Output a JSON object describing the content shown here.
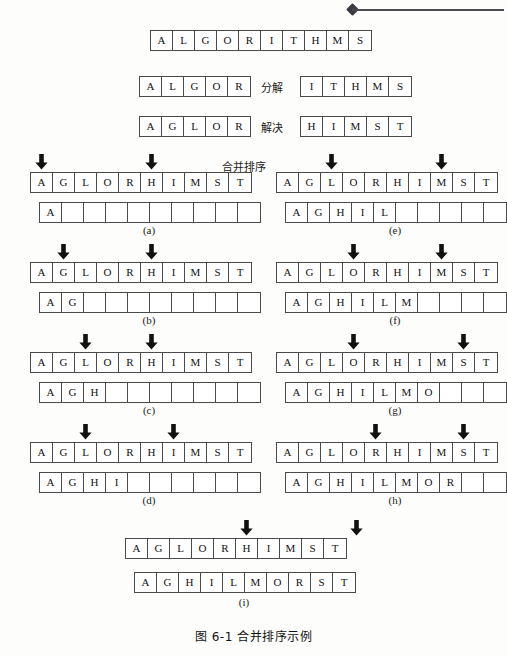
{
  "figure": {
    "caption": "图 6-1  合并排序示例",
    "header_decoration": "diamond-rule"
  },
  "stages": {
    "full": {
      "label": "",
      "cells": [
        "A",
        "L",
        "G",
        "O",
        "R",
        "I",
        "T",
        "H",
        "M",
        "S"
      ]
    },
    "divide": {
      "label": "分解",
      "left": [
        "A",
        "L",
        "G",
        "O",
        "R"
      ],
      "right": [
        "I",
        "T",
        "H",
        "M",
        "S"
      ]
    },
    "conquer": {
      "label": "解决",
      "left": [
        "A",
        "G",
        "L",
        "O",
        "R"
      ],
      "right": [
        "H",
        "I",
        "M",
        "S",
        "T"
      ]
    },
    "merge_label": "合并排序"
  },
  "panels": [
    {
      "id": "a",
      "label": "(a)",
      "left": [
        "A",
        "G",
        "L",
        "O",
        "R"
      ],
      "right": [
        "H",
        "I",
        "M",
        "S",
        "T"
      ],
      "left_pointer": 1,
      "right_pointer": 1,
      "output": [
        "A",
        "",
        "",
        "",
        "",
        "",
        "",
        "",
        "",
        ""
      ]
    },
    {
      "id": "b",
      "label": "(b)",
      "left": [
        "A",
        "G",
        "L",
        "O",
        "R"
      ],
      "right": [
        "H",
        "I",
        "M",
        "S",
        "T"
      ],
      "left_pointer": 2,
      "right_pointer": 1,
      "output": [
        "A",
        "G",
        "",
        "",
        "",
        "",
        "",
        "",
        "",
        ""
      ]
    },
    {
      "id": "c",
      "label": "(c)",
      "left": [
        "A",
        "G",
        "L",
        "O",
        "R"
      ],
      "right": [
        "H",
        "I",
        "M",
        "S",
        "T"
      ],
      "left_pointer": 3,
      "right_pointer": 1,
      "output": [
        "A",
        "G",
        "H",
        "",
        "",
        "",
        "",
        "",
        "",
        ""
      ]
    },
    {
      "id": "d",
      "label": "(d)",
      "left": [
        "A",
        "G",
        "L",
        "O",
        "R"
      ],
      "right": [
        "H",
        "I",
        "M",
        "S",
        "T"
      ],
      "left_pointer": 3,
      "right_pointer": 2,
      "output": [
        "A",
        "G",
        "H",
        "I",
        "",
        "",
        "",
        "",
        "",
        ""
      ]
    },
    {
      "id": "e",
      "label": "(e)",
      "left": [
        "A",
        "G",
        "L",
        "O",
        "R"
      ],
      "right": [
        "H",
        "I",
        "M",
        "S",
        "T"
      ],
      "left_pointer": 3,
      "right_pointer": 3,
      "output": [
        "A",
        "G",
        "H",
        "I",
        "L",
        "",
        "",
        "",
        "",
        ""
      ]
    },
    {
      "id": "f",
      "label": "(f)",
      "left": [
        "A",
        "G",
        "L",
        "O",
        "R"
      ],
      "right": [
        "H",
        "I",
        "M",
        "S",
        "T"
      ],
      "left_pointer": 4,
      "right_pointer": 3,
      "output": [
        "A",
        "G",
        "H",
        "I",
        "L",
        "M",
        "",
        "",
        "",
        ""
      ]
    },
    {
      "id": "g",
      "label": "(g)",
      "left": [
        "A",
        "G",
        "L",
        "O",
        "R"
      ],
      "right": [
        "H",
        "I",
        "M",
        "S",
        "T"
      ],
      "left_pointer": 4,
      "right_pointer": 4,
      "output": [
        "A",
        "G",
        "H",
        "I",
        "L",
        "M",
        "O",
        "",
        "",
        ""
      ]
    },
    {
      "id": "h",
      "label": "(h)",
      "left": [
        "A",
        "G",
        "L",
        "O",
        "R"
      ],
      "right": [
        "H",
        "I",
        "M",
        "S",
        "T"
      ],
      "left_pointer": 5,
      "right_pointer": 4,
      "output": [
        "A",
        "G",
        "H",
        "I",
        "L",
        "M",
        "O",
        "R",
        "",
        ""
      ]
    },
    {
      "id": "i",
      "label": "(i)",
      "left": [
        "A",
        "G",
        "L",
        "O",
        "R"
      ],
      "right": [
        "H",
        "I",
        "M",
        "S",
        "T"
      ],
      "left_pointer": 6,
      "right_pointer": 6,
      "output": [
        "A",
        "G",
        "H",
        "I",
        "L",
        "M",
        "O",
        "R",
        "S",
        "T"
      ]
    }
  ],
  "colors": {
    "ink": "#1a1a1a",
    "border": "#4a4a4a",
    "arrow": "#111111",
    "paper": "#fdfdfc"
  }
}
